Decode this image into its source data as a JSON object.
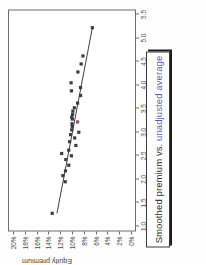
{
  "title": {
    "full": "Smoothed premium vs. unadjusted average",
    "prefix": "Smoothed premium vs. ",
    "highlight": "unadjusted average",
    "highlight_color": "#5a5fa8",
    "border_color": "#3a3a3a",
    "shadow_color": "#1d1d1d"
  },
  "chart_data": {
    "type": "scatter",
    "title": "Smoothed premium vs. unadjusted average",
    "xlabel": "",
    "ylabel": "Equity premium",
    "xlim": [
      1.0,
      5.5
    ],
    "ylim": [
      0,
      20
    ],
    "grid": false,
    "legend": null,
    "xticks": [
      "1.0",
      "1.5",
      "2.0",
      "2.5",
      "3.0",
      "3.5",
      "4.0",
      "4.5",
      "5.0",
      "5.5"
    ],
    "xtick_values": [
      1.0,
      1.5,
      2.0,
      2.5,
      3.0,
      3.5,
      4.0,
      4.5,
      5.0,
      5.5
    ],
    "yticks": [
      "0%",
      "2%",
      "4%",
      "6%",
      "8%",
      "10%",
      "12%",
      "14%",
      "16%",
      "18%",
      "20%"
    ],
    "ytick_values": [
      0,
      2,
      4,
      6,
      8,
      10,
      12,
      14,
      16,
      18,
      20
    ],
    "marker_color": "#3c3c44",
    "marker_shape": "square",
    "marker_size": 3.2,
    "trendline": {
      "color": "#2a2a2a",
      "x": [
        1.28,
        5.22
      ],
      "y": [
        12.55,
        6.55
      ]
    },
    "points": [
      {
        "x": 1.28,
        "y": 13.35
      },
      {
        "x": 1.95,
        "y": 11.15
      },
      {
        "x": 2.08,
        "y": 11.55
      },
      {
        "x": 2.18,
        "y": 11.1
      },
      {
        "x": 2.3,
        "y": 10.55
      },
      {
        "x": 2.42,
        "y": 11.05
      },
      {
        "x": 2.5,
        "y": 10.1
      },
      {
        "x": 2.55,
        "y": 11.75
      },
      {
        "x": 2.62,
        "y": 10.55
      },
      {
        "x": 2.72,
        "y": 9.35
      },
      {
        "x": 2.8,
        "y": 10.4
      },
      {
        "x": 2.88,
        "y": 9.55
      },
      {
        "x": 2.95,
        "y": 10.25
      },
      {
        "x": 3.0,
        "y": 8.85
      },
      {
        "x": 3.05,
        "y": 10.05
      },
      {
        "x": 3.12,
        "y": 9.95
      },
      {
        "x": 3.18,
        "y": 10.0
      },
      {
        "x": 3.22,
        "y": 9.05,
        "color": "#9d4b55"
      },
      {
        "x": 3.28,
        "y": 9.95
      },
      {
        "x": 3.32,
        "y": 10.05
      },
      {
        "x": 3.38,
        "y": 9.9
      },
      {
        "x": 3.45,
        "y": 9.85
      },
      {
        "x": 3.52,
        "y": 9.6
      },
      {
        "x": 3.62,
        "y": 9.05
      },
      {
        "x": 3.78,
        "y": 8.55
      },
      {
        "x": 3.88,
        "y": 10.1
      },
      {
        "x": 3.95,
        "y": 8.55
      },
      {
        "x": 4.05,
        "y": 10.15
      },
      {
        "x": 4.28,
        "y": 9.0
      },
      {
        "x": 4.45,
        "y": 8.45
      },
      {
        "x": 4.62,
        "y": 8.15
      },
      {
        "x": 5.22,
        "y": 6.55
      }
    ]
  }
}
